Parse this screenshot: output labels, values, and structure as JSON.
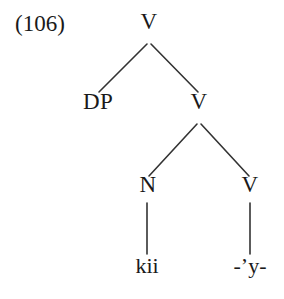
{
  "figure": {
    "example_number": "(106)",
    "background_color": "#ffffff",
    "line_color": "#333333",
    "text_color": "#1a1a1a"
  },
  "tree": {
    "nodes": [
      {
        "id": "root-v",
        "label": "V",
        "x": 149,
        "y": 33,
        "kind": "category"
      },
      {
        "id": "dp",
        "label": "DP",
        "x": 98,
        "y": 113,
        "kind": "category"
      },
      {
        "id": "inner-v",
        "label": "V",
        "x": 199,
        "y": 113,
        "kind": "category"
      },
      {
        "id": "n",
        "label": "N",
        "x": 148,
        "y": 196,
        "kind": "category"
      },
      {
        "id": "leaf-v",
        "label": "V",
        "x": 250,
        "y": 196,
        "kind": "category"
      },
      {
        "id": "terminal-kii",
        "label": "kii",
        "x": 147,
        "y": 277,
        "kind": "terminal"
      },
      {
        "id": "terminal-y",
        "label": "-’y-",
        "x": 250,
        "y": 277,
        "kind": "terminal"
      }
    ],
    "edges": [
      {
        "id": "edge-root-dp",
        "from": "root-v",
        "to": "dp",
        "x1": 147,
        "y1": 44,
        "x2": 99,
        "y2": 92
      },
      {
        "id": "edge-root-innerv",
        "from": "root-v",
        "to": "inner-v",
        "x1": 151,
        "y1": 44,
        "x2": 198,
        "y2": 92
      },
      {
        "id": "edge-innerv-n",
        "from": "inner-v",
        "to": "n",
        "x1": 197,
        "y1": 124,
        "x2": 149,
        "y2": 176
      },
      {
        "id": "edge-innerv-leafv",
        "from": "inner-v",
        "to": "leaf-v",
        "x1": 201,
        "y1": 124,
        "x2": 249,
        "y2": 176
      },
      {
        "id": "edge-n-kii",
        "from": "n",
        "to": "terminal-kii",
        "x1": 147,
        "y1": 203,
        "x2": 147,
        "y2": 254
      },
      {
        "id": "edge-leafv-y",
        "from": "leaf-v",
        "to": "terminal-y",
        "x1": 250,
        "y1": 203,
        "x2": 250,
        "y2": 254
      }
    ]
  }
}
